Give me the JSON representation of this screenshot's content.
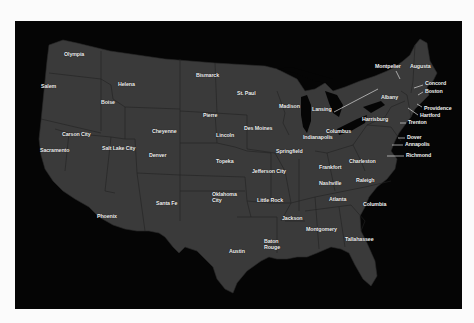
{
  "map": {
    "title": "United States State Capitals",
    "colors": {
      "page_bg": "#fbfbfb",
      "panel_bg": "#050505",
      "land": "#3a3a3a",
      "border": "#1e1e1e",
      "label": "#f2f2f2",
      "leader": "#d8d8d8"
    },
    "capitals": [
      {
        "name": "Olympia",
        "x": 64,
        "y": 54
      },
      {
        "name": "Salem",
        "x": 41,
        "y": 86
      },
      {
        "name": "Helena",
        "x": 118,
        "y": 84
      },
      {
        "name": "Boise",
        "x": 101,
        "y": 102
      },
      {
        "name": "Bismarck",
        "x": 196,
        "y": 75
      },
      {
        "name": "St. Paul",
        "x": 237,
        "y": 93
      },
      {
        "name": "Pierre",
        "x": 203,
        "y": 115
      },
      {
        "name": "Madison",
        "x": 279,
        "y": 106
      },
      {
        "name": "Lansing",
        "x": 312,
        "y": 109
      },
      {
        "name": "Montpelier",
        "x": 375,
        "y": 66
      },
      {
        "name": "Augusta",
        "x": 410,
        "y": 66
      },
      {
        "name": "Concord",
        "x": 425,
        "y": 83
      },
      {
        "name": "Boston",
        "x": 425,
        "y": 91
      },
      {
        "name": "Albany",
        "x": 381,
        "y": 97
      },
      {
        "name": "Providence",
        "x": 424,
        "y": 108
      },
      {
        "name": "Hartford",
        "x": 420,
        "y": 115
      },
      {
        "name": "Harrisburg",
        "x": 362,
        "y": 119
      },
      {
        "name": "Trenton",
        "x": 408,
        "y": 122
      },
      {
        "name": "Carson City",
        "x": 62,
        "y": 134
      },
      {
        "name": "Cheyenne",
        "x": 152,
        "y": 131
      },
      {
        "name": "Lincoln",
        "x": 216,
        "y": 135
      },
      {
        "name": "Des Moines",
        "x": 244,
        "y": 128
      },
      {
        "name": "Columbus",
        "x": 326,
        "y": 131
      },
      {
        "name": "Indianapolis",
        "x": 303,
        "y": 137
      },
      {
        "name": "Sacramento",
        "x": 40,
        "y": 150
      },
      {
        "name": "Salt Lake City",
        "x": 102,
        "y": 148
      },
      {
        "name": "Denver",
        "x": 149,
        "y": 155
      },
      {
        "name": "Springfield",
        "x": 276,
        "y": 151
      },
      {
        "name": "Dover",
        "x": 407,
        "y": 137
      },
      {
        "name": "Annapolis",
        "x": 405,
        "y": 144
      },
      {
        "name": "Richmond",
        "x": 406,
        "y": 155
      },
      {
        "name": "Topeka",
        "x": 216,
        "y": 161
      },
      {
        "name": "Charleston",
        "x": 349,
        "y": 161
      },
      {
        "name": "Frankfort",
        "x": 319,
        "y": 167
      },
      {
        "name": "Jefferson City",
        "x": 252,
        "y": 171
      },
      {
        "name": "Raleigh",
        "x": 356,
        "y": 180
      },
      {
        "name": "Nashville",
        "x": 319,
        "y": 183
      },
      {
        "name": "Oklahoma City",
        "x": 212,
        "y": 194,
        "multiline": true
      },
      {
        "name": "Little Rock",
        "x": 257,
        "y": 200
      },
      {
        "name": "Atlanta",
        "x": 329,
        "y": 199
      },
      {
        "name": "Santa Fe",
        "x": 156,
        "y": 203
      },
      {
        "name": "Columbia",
        "x": 363,
        "y": 204
      },
      {
        "name": "Phoenix",
        "x": 97,
        "y": 216
      },
      {
        "name": "Jackson",
        "x": 282,
        "y": 218
      },
      {
        "name": "Montgomery",
        "x": 306,
        "y": 229
      },
      {
        "name": "Tallahassee",
        "x": 345,
        "y": 239
      },
      {
        "name": "Baton Rouge",
        "x": 264,
        "y": 241,
        "multiline": true
      },
      {
        "name": "Austin",
        "x": 229,
        "y": 251
      }
    ],
    "leaders": [
      {
        "name": "Montpelier",
        "x1": 396,
        "y1": 71,
        "x2": 400,
        "y2": 79
      },
      {
        "name": "Concord",
        "x1": 423,
        "y1": 85,
        "x2": 414,
        "y2": 88
      },
      {
        "name": "Boston",
        "x1": 423,
        "y1": 92,
        "x2": 418,
        "y2": 95
      },
      {
        "name": "Lansing",
        "x1": 334,
        "y1": 112,
        "x2": 378,
        "y2": 89
      },
      {
        "name": "Providence",
        "x1": 422,
        "y1": 107,
        "x2": 417,
        "y2": 104
      },
      {
        "name": "Hartford",
        "x1": 418,
        "y1": 115,
        "x2": 408,
        "y2": 108
      },
      {
        "name": "Trenton",
        "x1": 406,
        "y1": 123,
        "x2": 400,
        "y2": 123
      },
      {
        "name": "Dover",
        "x1": 405,
        "y1": 138,
        "x2": 398,
        "y2": 138
      },
      {
        "name": "Annapolis",
        "x1": 403,
        "y1": 145,
        "x2": 392,
        "y2": 145
      },
      {
        "name": "Richmond",
        "x1": 404,
        "y1": 156,
        "x2": 387,
        "y2": 156
      }
    ]
  }
}
